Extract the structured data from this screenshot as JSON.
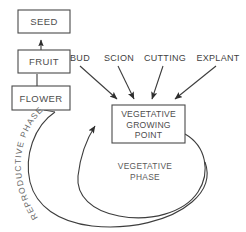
{
  "diagram": {
    "colors": {
      "stroke": "#3d3d3d",
      "box_stroke": "#4a4a4a",
      "text": "#4d4d4d",
      "background": "#ffffff"
    },
    "boxes": [
      {
        "id": "seed",
        "label": "SEED"
      },
      {
        "id": "fruit",
        "label": "FRUIT"
      },
      {
        "id": "flower",
        "label": "FLOWER"
      }
    ],
    "center_box": {
      "id": "vegetative-growing-point",
      "line1": "VEGETATIVE",
      "line2": "GROWING",
      "line3": "POINT"
    },
    "inputs": [
      {
        "id": "bud",
        "label": "BUD"
      },
      {
        "id": "scion",
        "label": "SCION"
      },
      {
        "id": "cutting",
        "label": "CUTTING"
      },
      {
        "id": "explant",
        "label": "EXPLANT"
      }
    ],
    "phases": {
      "vegetative_line1": "VEGETATIVE",
      "vegetative_line2": "PHASE",
      "reproductive": "REPRODUCTIVE  PHASE"
    }
  }
}
